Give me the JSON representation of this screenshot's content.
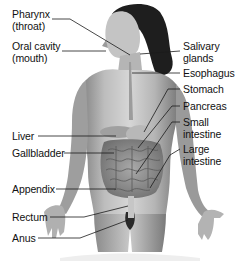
{
  "diagram": {
    "labels_left": [
      {
        "id": "pharynx",
        "lines": [
          "Pharynx",
          "(throat)"
        ],
        "x": 12,
        "y": 8
      },
      {
        "id": "oral-cavity",
        "lines": [
          "Oral cavity",
          "(mouth)"
        ],
        "x": 12,
        "y": 40
      },
      {
        "id": "liver",
        "text": "Liver",
        "x": 12,
        "y": 130
      },
      {
        "id": "gallbladder",
        "text": "Gallbladder",
        "x": 12,
        "y": 147
      },
      {
        "id": "appendix",
        "text": "Appendix",
        "x": 12,
        "y": 183
      },
      {
        "id": "rectum",
        "text": "Rectum",
        "x": 12,
        "y": 211
      },
      {
        "id": "anus",
        "text": "Anus",
        "x": 12,
        "y": 232
      }
    ],
    "labels_right": [
      {
        "id": "salivary-glands",
        "lines": [
          "Salivary",
          "glands"
        ],
        "x": 183,
        "y": 40
      },
      {
        "id": "esophagus",
        "text": "Esophagus",
        "x": 183,
        "y": 67
      },
      {
        "id": "stomach",
        "text": "Stomach",
        "x": 183,
        "y": 83
      },
      {
        "id": "pancreas",
        "text": "Pancreas",
        "x": 183,
        "y": 100
      },
      {
        "id": "small-intestine",
        "lines": [
          "Small",
          "intestine"
        ],
        "x": 183,
        "y": 116
      },
      {
        "id": "large-intestine",
        "lines": [
          "Large",
          "intestine"
        ],
        "x": 183,
        "y": 143
      }
    ],
    "colors": {
      "background": "#ffffff",
      "text": "#111111",
      "leader_line": "#1a1a1a",
      "skin_light": "#d9d9d9",
      "skin_mid": "#a8a8a8",
      "skin_dark": "#6e6e6e",
      "hair": "#1e1e1e"
    }
  }
}
